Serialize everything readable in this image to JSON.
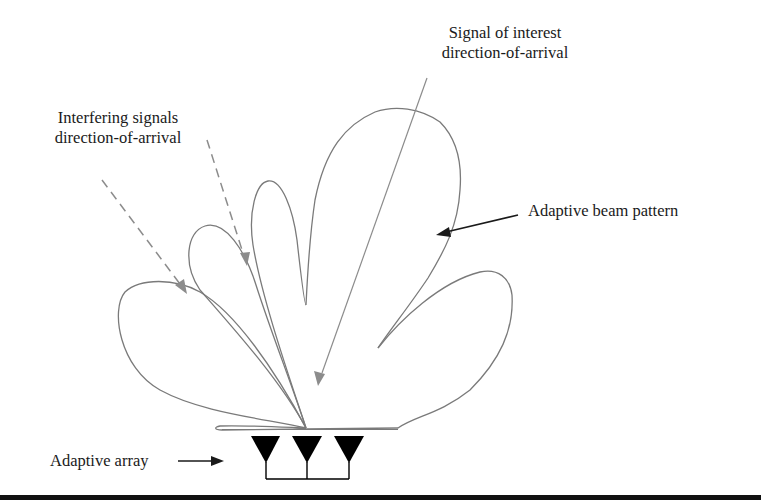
{
  "figure": {
    "type": "adaptive-beamforming-diagram",
    "labels": {
      "signal_of_interest": [
        "Signal of interest",
        "direction-of-arrival"
      ],
      "interfering_signals": [
        "Interfering signals",
        "direction-of-arrival"
      ],
      "beam_pattern": "Adaptive beam pattern",
      "array": "Adaptive array"
    },
    "beam_pattern": {
      "main_lobe_count": 1,
      "side_lobe_count": 4,
      "nulls_toward_interferers": 2
    },
    "array": {
      "element_count": 3
    },
    "interfering_signal_count": 2,
    "colors": {
      "pattern_stroke": "#7a7a7a",
      "doa_arrow": "#8c8c8c",
      "pointer_arrow": "#1a1a1a",
      "antenna": "#000000"
    }
  }
}
